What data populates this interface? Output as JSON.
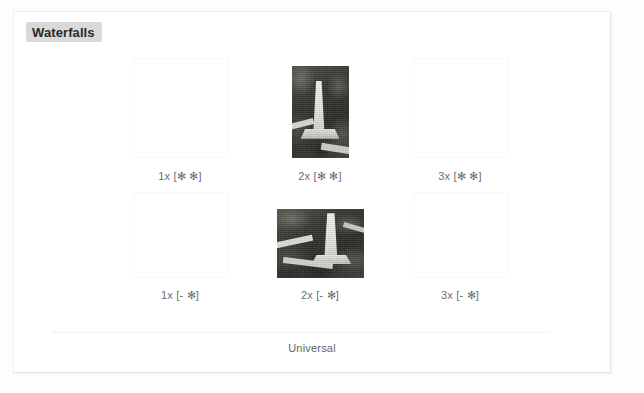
{
  "panel": {
    "title": "Waterfalls",
    "title_background": "#d9d9d9",
    "background": "#ffffff",
    "border_color": "#e4e4e4"
  },
  "gallery": {
    "rows": [
      {
        "id": "row-1",
        "cells": [
          {
            "caption": "1x [✻ ✻]",
            "image_loaded": false,
            "alt_icon": "broken-image-icon"
          },
          {
            "caption": "2x [✻ ✻]",
            "image_loaded": true,
            "orientation": "portrait",
            "subject": "waterfall-photo"
          },
          {
            "caption": "3x [✻ ✻]",
            "image_loaded": false,
            "alt_icon": "broken-image-icon"
          }
        ]
      },
      {
        "id": "row-2",
        "cells": [
          {
            "caption": "1x [- ✻]",
            "image_loaded": false,
            "alt_icon": "broken-image-icon"
          },
          {
            "caption": "2x [- ✻]",
            "image_loaded": true,
            "orientation": "landscape",
            "subject": "waterfall-photo"
          },
          {
            "caption": "3x [- ✻]",
            "image_loaded": false,
            "alt_icon": "broken-image-icon"
          }
        ]
      }
    ]
  },
  "footer": {
    "label": "Universal"
  }
}
